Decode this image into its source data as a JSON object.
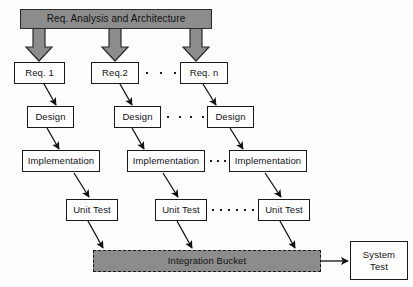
{
  "diagram": {
    "banner": {
      "label": "Req. Analysis and Architecture"
    },
    "rows": {
      "requirements": [
        {
          "label": "Req. 1"
        },
        {
          "label": "Req.2"
        },
        {
          "label": "Req. n"
        }
      ],
      "design": [
        {
          "label": "Design"
        },
        {
          "label": "Design"
        },
        {
          "label": "Design"
        }
      ],
      "implementation": [
        {
          "label": "Implementation"
        },
        {
          "label": "Implementation"
        },
        {
          "label": "Implementation"
        }
      ],
      "unit_test": [
        {
          "label": "Unit Test"
        },
        {
          "label": "Unit Test"
        },
        {
          "label": "Unit Test"
        }
      ]
    },
    "bucket": {
      "label": "Integration Bucket"
    },
    "system_test": {
      "label_line1": "System",
      "label_line2": "Test"
    },
    "ellipsis": {
      "requirements_dots": 3,
      "design_dots": 4,
      "implementation_dots": 3,
      "unit_test_dots": 6
    },
    "colors": {
      "fill_gray": "#8c8c8c",
      "border_dark": "#1a1a1a",
      "box_fill": "#ffffff",
      "background": "#fdfdfd"
    }
  }
}
